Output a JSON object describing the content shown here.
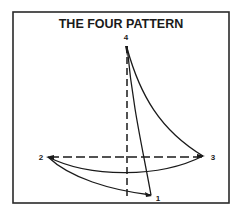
{
  "diagram": {
    "title": "THE FOUR PATTERN",
    "points": [
      {
        "id": "1",
        "label": "1"
      },
      {
        "id": "2",
        "label": "2"
      },
      {
        "id": "3",
        "label": "3"
      },
      {
        "id": "4",
        "label": "4"
      }
    ],
    "colors": {
      "stroke": "#1a1a1a",
      "background": "#ffffff",
      "frame": "#2a2a2a"
    },
    "elements": [
      "frame",
      "vertical-dashed-axis",
      "horizontal-dashed-axis",
      "curve-1-to-4",
      "curve-4-to-3",
      "curve-3-to-2",
      "curve-2-to-1"
    ]
  }
}
